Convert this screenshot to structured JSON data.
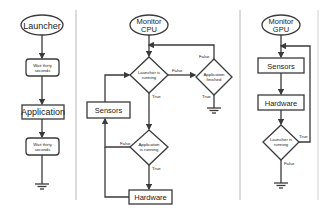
{
  "colors": {
    "stroke": "#3a3a3a",
    "divider": "#b8b8b8",
    "text": "#222222",
    "background": "#ffffff"
  },
  "launcher": {
    "start": "Launcher",
    "wait1": [
      "Wait thirty",
      "seconds"
    ],
    "app": "Application",
    "wait2": [
      "Wait thirty",
      "seconds"
    ]
  },
  "cpu": {
    "start": [
      "Monitor",
      "CPU"
    ],
    "dec_launcher": [
      "Launcher is",
      "running"
    ],
    "dec_app_finished": [
      "Application",
      "finished"
    ],
    "sensors": "Sensors",
    "dec_app_running": [
      "Application",
      "is running"
    ],
    "hardware": "Hardware",
    "labels": {
      "false1": "False",
      "true1": "True",
      "false2": "False",
      "true2": "True",
      "false3": "False",
      "true3": "True"
    }
  },
  "gpu": {
    "start": [
      "Monitor",
      "GPU"
    ],
    "sensors": "Sensors",
    "hardware": "Hardware",
    "dec_launcher": [
      "Launcher is",
      "running"
    ],
    "labels": {
      "true": "True",
      "false": "False"
    }
  }
}
